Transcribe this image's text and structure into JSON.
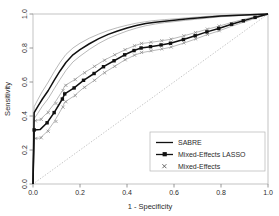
{
  "chart_data": {
    "type": "line",
    "title": "",
    "xlabel": "1 - Specificity",
    "ylabel": "Sensitivity",
    "xlim": [
      0,
      1
    ],
    "ylim": [
      0,
      1
    ],
    "grid": false,
    "legend_position": "bottom-right",
    "xticks": [
      "0.0",
      "0.2",
      "0.4",
      "0.6",
      "0.8",
      "1.0"
    ],
    "xtick_values": [
      0.0,
      0.2,
      0.4,
      0.6,
      0.8,
      1.0
    ],
    "yticks": [
      "0.0",
      "0.2",
      "0.4",
      "0.6",
      "0.8",
      "1.0"
    ],
    "ytick_values": [
      0.0,
      0.2,
      0.4,
      0.6,
      0.8,
      1.0
    ],
    "series": [
      {
        "name": "SABRE",
        "style": "solid-line",
        "color": "#111111",
        "x": [
          0.0,
          0.005,
          0.02,
          0.04,
          0.065,
          0.09,
          0.115,
          0.14,
          0.17,
          0.2,
          0.24,
          0.28,
          0.32,
          0.36,
          0.4,
          0.44,
          0.48,
          0.52,
          0.56,
          0.6,
          0.65,
          0.7,
          0.75,
          0.8,
          0.85,
          0.9,
          0.95,
          1.0
        ],
        "y": [
          0.0,
          0.42,
          0.455,
          0.5,
          0.55,
          0.61,
          0.665,
          0.715,
          0.76,
          0.79,
          0.825,
          0.855,
          0.88,
          0.9,
          0.918,
          0.932,
          0.944,
          0.952,
          0.958,
          0.963,
          0.97,
          0.976,
          0.982,
          0.988,
          0.991,
          0.994,
          0.997,
          1.0
        ]
      },
      {
        "name": "SABRE upper confidence band",
        "style": "thin-gray-line",
        "color": "#9a9a9a",
        "x": [
          0.0,
          0.005,
          0.02,
          0.04,
          0.065,
          0.09,
          0.115,
          0.14,
          0.17,
          0.2,
          0.24,
          0.28,
          0.32,
          0.36,
          0.4,
          0.44,
          0.48,
          0.52,
          0.56,
          0.6,
          0.65,
          0.7,
          0.75,
          0.8,
          0.85,
          0.9,
          0.95,
          1.0
        ],
        "y": [
          0.0,
          0.455,
          0.495,
          0.545,
          0.6,
          0.66,
          0.715,
          0.762,
          0.8,
          0.828,
          0.858,
          0.882,
          0.903,
          0.92,
          0.934,
          0.946,
          0.955,
          0.962,
          0.967,
          0.971,
          0.977,
          0.982,
          0.987,
          0.991,
          0.994,
          0.996,
          0.998,
          1.0
        ]
      },
      {
        "name": "SABRE lower confidence band",
        "style": "thin-gray-line",
        "color": "#9a9a9a",
        "x": [
          0.0,
          0.005,
          0.02,
          0.04,
          0.065,
          0.09,
          0.115,
          0.14,
          0.17,
          0.2,
          0.24,
          0.28,
          0.32,
          0.36,
          0.4,
          0.44,
          0.48,
          0.52,
          0.56,
          0.6,
          0.65,
          0.7,
          0.75,
          0.8,
          0.85,
          0.9,
          0.95,
          1.0
        ],
        "y": [
          0.0,
          0.385,
          0.415,
          0.458,
          0.503,
          0.56,
          0.615,
          0.668,
          0.718,
          0.752,
          0.792,
          0.827,
          0.856,
          0.879,
          0.9,
          0.917,
          0.931,
          0.941,
          0.949,
          0.955,
          0.963,
          0.97,
          0.977,
          0.984,
          0.988,
          0.992,
          0.996,
          1.0
        ]
      },
      {
        "name": "Mixed-Effects LASSO",
        "style": "line-with-square-markers",
        "color": "#111111",
        "x": [
          0.0,
          0.005,
          0.03,
          0.06,
          0.09,
          0.125,
          0.135,
          0.175,
          0.215,
          0.26,
          0.3,
          0.345,
          0.39,
          0.43,
          0.46,
          0.5,
          0.545,
          0.585,
          0.64,
          0.69,
          0.74,
          0.79,
          0.845,
          0.895,
          0.945,
          1.0
        ],
        "y": [
          0.0,
          0.318,
          0.32,
          0.36,
          0.42,
          0.5,
          0.53,
          0.565,
          0.61,
          0.65,
          0.69,
          0.725,
          0.76,
          0.785,
          0.8,
          0.808,
          0.818,
          0.828,
          0.85,
          0.872,
          0.895,
          0.915,
          0.94,
          0.96,
          0.98,
          1.0
        ],
        "marker_x": [
          0.005,
          0.06,
          0.09,
          0.125,
          0.135,
          0.175,
          0.215,
          0.26,
          0.3,
          0.345,
          0.39,
          0.43,
          0.46,
          0.5,
          0.545,
          0.585,
          0.64,
          0.69,
          0.74,
          0.79,
          0.845,
          0.895,
          0.945
        ],
        "marker_y": [
          0.318,
          0.36,
          0.42,
          0.5,
          0.53,
          0.565,
          0.61,
          0.65,
          0.69,
          0.725,
          0.76,
          0.785,
          0.8,
          0.808,
          0.818,
          0.828,
          0.85,
          0.872,
          0.895,
          0.915,
          0.94,
          0.96,
          0.98
        ]
      },
      {
        "name": "Mixed-Effects LASSO upper confidence band",
        "style": "thin-gray-line",
        "color": "#9a9a9a",
        "x": [
          0.0,
          0.005,
          0.03,
          0.06,
          0.09,
          0.125,
          0.135,
          0.175,
          0.215,
          0.26,
          0.3,
          0.345,
          0.39,
          0.43,
          0.46,
          0.5,
          0.545,
          0.585,
          0.64,
          0.69,
          0.74,
          0.79,
          0.845,
          0.895,
          0.945,
          1.0
        ],
        "y": [
          0.0,
          0.372,
          0.378,
          0.418,
          0.472,
          0.548,
          0.578,
          0.612,
          0.652,
          0.69,
          0.726,
          0.758,
          0.789,
          0.812,
          0.826,
          0.833,
          0.842,
          0.851,
          0.871,
          0.89,
          0.91,
          0.928,
          0.95,
          0.968,
          0.985,
          1.0
        ]
      },
      {
        "name": "Mixed-Effects LASSO lower confidence band",
        "style": "thin-gray-line",
        "color": "#9a9a9a",
        "x": [
          0.0,
          0.005,
          0.03,
          0.06,
          0.09,
          0.125,
          0.135,
          0.175,
          0.215,
          0.26,
          0.3,
          0.345,
          0.39,
          0.43,
          0.46,
          0.5,
          0.545,
          0.585,
          0.64,
          0.69,
          0.74,
          0.79,
          0.845,
          0.895,
          0.945,
          1.0
        ],
        "y": [
          0.0,
          0.268,
          0.27,
          0.308,
          0.366,
          0.45,
          0.482,
          0.518,
          0.566,
          0.608,
          0.652,
          0.69,
          0.729,
          0.756,
          0.772,
          0.782,
          0.793,
          0.804,
          0.828,
          0.852,
          0.878,
          0.9,
          0.928,
          0.951,
          0.974,
          1.0
        ]
      },
      {
        "name": "Mixed-Effects",
        "style": "x-markers-only",
        "color": "#8c8c8c",
        "marker_x": [
          0.01,
          0.012,
          0.035,
          0.035,
          0.065,
          0.065,
          0.098,
          0.098,
          0.128,
          0.128,
          0.14,
          0.14,
          0.18,
          0.18,
          0.22,
          0.22,
          0.262,
          0.262,
          0.305,
          0.305,
          0.348,
          0.348,
          0.392,
          0.392,
          0.432,
          0.432,
          0.462,
          0.462,
          0.502,
          0.502,
          0.548,
          0.548,
          0.588,
          0.588,
          0.642,
          0.642,
          0.692,
          0.692,
          0.742,
          0.742,
          0.792,
          0.792
        ],
        "marker_y": [
          0.372,
          0.268,
          0.38,
          0.272,
          0.42,
          0.31,
          0.474,
          0.368,
          0.55,
          0.452,
          0.58,
          0.484,
          0.614,
          0.52,
          0.654,
          0.568,
          0.692,
          0.61,
          0.728,
          0.654,
          0.76,
          0.692,
          0.79,
          0.731,
          0.813,
          0.758,
          0.827,
          0.774,
          0.834,
          0.784,
          0.843,
          0.795,
          0.852,
          0.806,
          0.872,
          0.83,
          0.891,
          0.854,
          0.911,
          0.88,
          0.929,
          0.902
        ]
      },
      {
        "name": "chance diagonal",
        "style": "dotted-reference-line",
        "color": "#bdbdbd",
        "x": [
          0.0,
          1.0
        ],
        "y": [
          0.0,
          1.0
        ]
      }
    ],
    "legend": [
      {
        "label": "SABRE",
        "marker": "line"
      },
      {
        "label": "Mixed-Effects LASSO",
        "marker": "line-square"
      },
      {
        "label": "Mixed-Effects",
        "marker": "x"
      }
    ]
  },
  "colors": {
    "curve": "#111111",
    "band": "#9a9a9a",
    "marker_gray": "#8c8c8c",
    "diagonal": "#bdbdbd",
    "frame": "#b5b5b5",
    "text": "#2b2b2b"
  }
}
